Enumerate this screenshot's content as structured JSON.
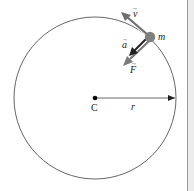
{
  "figure": {
    "labels": {
      "center": "C",
      "radius": "r",
      "mass": "m",
      "velocity": "v",
      "acceleration": "a",
      "force": "F"
    },
    "vector_marker": "→",
    "colors": {
      "circle": "#555555",
      "mass": "#808080",
      "velocity_arrow": "#6e6e6e",
      "acceleration_arrow": "#222222",
      "force_arrow": "#7a7a7a",
      "center_dot": "#000000",
      "radius_line": "#444444",
      "panel_background": "#ececec",
      "panel_border": "#9a9a9a"
    }
  }
}
